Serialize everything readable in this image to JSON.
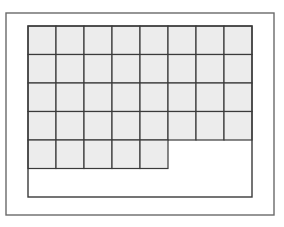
{
  "diagram": {
    "type": "unit-square-grid",
    "outer_frame": {
      "x": 6,
      "y": 13,
      "width": 268,
      "height": 202
    },
    "inner_rect": {
      "x": 28,
      "y": 26,
      "width": 224,
      "height": 171
    },
    "cell_width": 28,
    "cell_height": 28.5,
    "columns": 8,
    "rows": 6,
    "filled_rows": [
      {
        "row": 1,
        "filled_cells": 8
      },
      {
        "row": 2,
        "filled_cells": 8
      },
      {
        "row": 3,
        "filled_cells": 8
      },
      {
        "row": 4,
        "filled_cells": 8
      },
      {
        "row": 5,
        "filled_cells": 5
      },
      {
        "row": 6,
        "filled_cells": 0
      }
    ],
    "total_filled_cells": 37,
    "colors": {
      "cell_fill": "#ececec",
      "grid_line": "#3a3a3a",
      "outer_frame": "#6a6a6a",
      "background": "#ffffff"
    }
  }
}
